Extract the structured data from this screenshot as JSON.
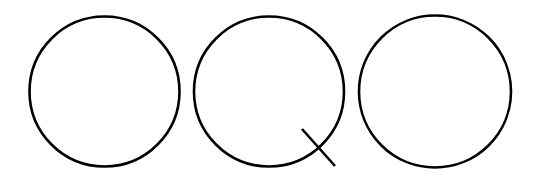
{
  "canvas": {
    "width": 540,
    "height": 186,
    "background": "#ffffff"
  },
  "style": {
    "stroke_color": "#000000",
    "stroke_width": 2.6
  },
  "shapes": [
    {
      "id": "circle-1",
      "type": "circle",
      "cx": 104.5,
      "cy": 91.5,
      "r": 75
    },
    {
      "id": "circle-2-q",
      "type": "circle",
      "cx": 269,
      "cy": 91.5,
      "r": 75,
      "tail": {
        "x1": 302,
        "y1": 129,
        "x2": 335,
        "y2": 166
      }
    },
    {
      "id": "circle-3",
      "type": "circle",
      "cx": 435,
      "cy": 91.5,
      "r": 76
    }
  ]
}
